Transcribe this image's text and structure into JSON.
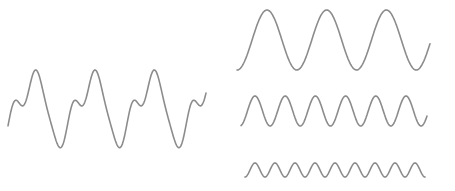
{
  "diagram": {
    "stroke_color": "#8c8c8c",
    "background": "#ffffff",
    "composite": {
      "label": "composite-wave",
      "x_start": 8,
      "x_end": 206,
      "period": 59.3,
      "baseline": 108,
      "components": [
        {
          "amp": 28,
          "harmonic": 1
        },
        {
          "amp": 14,
          "harmonic": 2
        },
        {
          "amp": 8,
          "harmonic": 3
        }
      ]
    },
    "components": [
      {
        "label": "component-wave-1",
        "x_start": 237,
        "x_end": 430,
        "baseline": 40,
        "amplitude": 30,
        "period": 59.7,
        "cycles": 3
      },
      {
        "label": "component-wave-2",
        "x_start": 241,
        "x_end": 427,
        "baseline": 111,
        "amplitude": 15,
        "period": 30.2,
        "cycles": 6
      },
      {
        "label": "component-wave-3",
        "x_start": 245,
        "x_end": 425,
        "baseline": 170,
        "amplitude": 7,
        "period": 20,
        "cycles": 9
      }
    ]
  }
}
